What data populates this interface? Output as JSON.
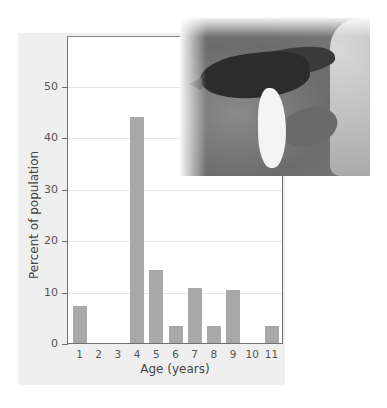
{
  "chart_data": {
    "type": "bar",
    "title": "",
    "xlabel": "Age (years)",
    "ylabel": "Percent of population",
    "categories": [
      "1",
      "2",
      "3",
      "4",
      "5",
      "6",
      "7",
      "8",
      "9",
      "10",
      "11"
    ],
    "values": [
      7.2,
      0,
      0,
      44,
      14.2,
      3.3,
      10.7,
      3.3,
      10.3,
      0,
      3.3
    ],
    "ylim": [
      0,
      60
    ],
    "yticks": [
      0,
      10,
      20,
      30,
      40,
      50
    ],
    "grid": true,
    "legend": null,
    "bar_color": "#a8a8a8"
  },
  "axis": {
    "xlabel": "Age (years)",
    "ylabel": "Percent of population",
    "yticks": [
      "0",
      "10",
      "20",
      "30",
      "40",
      "50"
    ],
    "xticks": [
      "1",
      "2",
      "3",
      "4",
      "5",
      "6",
      "7",
      "8",
      "9",
      "10",
      "11"
    ]
  },
  "photo": {
    "subject": "finch-on-cactus-photo"
  }
}
